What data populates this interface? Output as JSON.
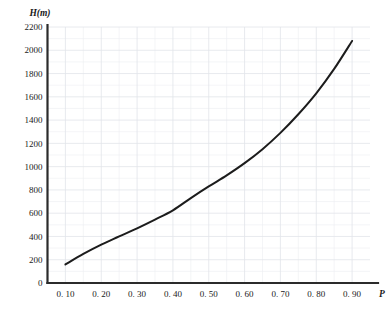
{
  "chart_data": {
    "type": "line",
    "title": "",
    "subtitle": "",
    "xlabel": "P",
    "ylabel": "H(m)",
    "ylabel_quantity": "H",
    "ylabel_unit": "m",
    "grid": true,
    "legend": "none",
    "xlim": [
      0.05,
      0.95
    ],
    "ylim": [
      0,
      2200
    ],
    "x_tick_labels": [
      "0. 10",
      "0. 20",
      "0. 30",
      "0. 40",
      "0. 50",
      "0. 60",
      "0. 70",
      "0. 80",
      "0. 90"
    ],
    "x_tick_values": [
      0.1,
      0.2,
      0.3,
      0.4,
      0.5,
      0.6,
      0.7,
      0.8,
      0.9
    ],
    "y_tick_labels": [
      "0",
      "200",
      "400",
      "600",
      "800",
      "1000",
      "1200",
      "1400",
      "1600",
      "1800",
      "2000",
      "2200"
    ],
    "y_tick_values": [
      0,
      200,
      400,
      600,
      800,
      1000,
      1200,
      1400,
      1600,
      1800,
      2000,
      2200
    ],
    "x": [
      0.1,
      0.15,
      0.2,
      0.25,
      0.3,
      0.35,
      0.4,
      0.45,
      0.5,
      0.55,
      0.6,
      0.65,
      0.7,
      0.75,
      0.8,
      0.85,
      0.9
    ],
    "values": [
      160,
      250,
      330,
      400,
      470,
      545,
      625,
      730,
      830,
      925,
      1030,
      1150,
      1290,
      1450,
      1630,
      1840,
      2080
    ],
    "series": [
      {
        "name": "H vs P",
        "values": [
          160,
          250,
          330,
          400,
          470,
          545,
          625,
          730,
          830,
          925,
          1030,
          1150,
          1290,
          1450,
          1630,
          1840,
          2080
        ]
      }
    ],
    "colors": {
      "curve": "#1c1c1c",
      "axis": "#2b2b2b",
      "grid_major": "#e2e5ea",
      "grid_minor": "#eceef1",
      "background": "#ffffff"
    }
  }
}
